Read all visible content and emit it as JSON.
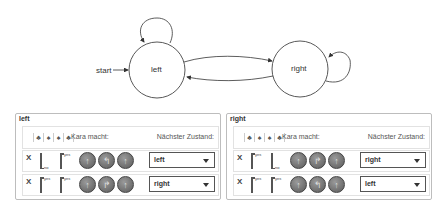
{
  "diagram": {
    "start_label": "start",
    "states": [
      {
        "name": "left",
        "cx": 157,
        "cy": 70,
        "r": 28
      },
      {
        "name": "right",
        "cx": 300,
        "cy": 69,
        "r": 28
      }
    ],
    "transitions": [
      {
        "from": "left",
        "to": "left",
        "type": "self-loop"
      },
      {
        "from": "left",
        "to": "right"
      },
      {
        "from": "right",
        "to": "left"
      },
      {
        "from": "right",
        "to": "right",
        "type": "self-loop"
      }
    ]
  },
  "panels": [
    {
      "title": "left",
      "header": {
        "sensor_icons": [
          "tree-sensor-icon",
          "leaf-sensor-icon",
          "leaf-sensor-icon",
          "tree-sensor-icon"
        ],
        "kara_label": "Kara macht:",
        "next_state_label": "Nächster Zustand:"
      },
      "rows": [
        {
          "delete": "X",
          "sensor1": "no",
          "sensor2": "yes",
          "commands": [
            "move-icon",
            "turn-left-icon",
            "move-icon"
          ],
          "next_state": "left"
        },
        {
          "delete": "X",
          "sensor1": "yes",
          "sensor2": "yes",
          "commands": [
            "move-icon",
            "turn-right-icon",
            "move-icon"
          ],
          "next_state": "right"
        }
      ]
    },
    {
      "title": "right",
      "header": {
        "sensor_icons": [
          "tree-sensor-icon",
          "leaf-sensor-icon",
          "leaf-sensor-icon",
          "tree-sensor-icon"
        ],
        "kara_label": "Kara macht:",
        "next_state_label": "Nächster Zustand:"
      },
      "rows": [
        {
          "delete": "X",
          "sensor1": "yes",
          "sensor2": "no",
          "commands": [
            "move-icon",
            "turn-right-icon",
            "move-icon"
          ],
          "next_state": "right"
        },
        {
          "delete": "X",
          "sensor1": "yes",
          "sensor2": "yes",
          "commands": [
            "move-icon",
            "turn-left-icon",
            "move-icon"
          ],
          "next_state": "left"
        }
      ]
    }
  ]
}
